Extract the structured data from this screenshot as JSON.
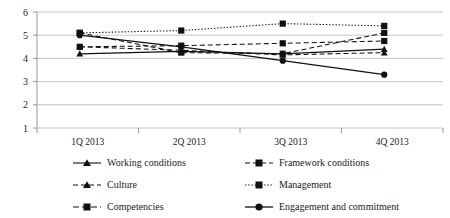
{
  "chart_data": {
    "type": "line",
    "title": "",
    "xlabel": "",
    "ylabel": "",
    "categories": [
      "1Q 2013",
      "2Q 2013",
      "3Q 2013",
      "4Q 2013"
    ],
    "ylim": [
      1,
      6
    ],
    "ytick_labels": [
      "1",
      "2",
      "3",
      "4",
      "5",
      "6"
    ],
    "yticks": [
      1,
      2,
      3,
      4,
      5,
      6
    ],
    "grid": true,
    "legend_position": "bottom",
    "series": [
      {
        "name": "Working conditions",
        "values": [
          4.2,
          4.3,
          4.2,
          4.4
        ],
        "line_style": "solid",
        "marker": "triangle"
      },
      {
        "name": "Framework conditions",
        "values": [
          4.5,
          4.55,
          4.65,
          4.75
        ],
        "line_style": "dashed",
        "marker": "square"
      },
      {
        "name": "Culture",
        "values": [
          4.5,
          4.35,
          4.15,
          4.25
        ],
        "line_style": "dashed",
        "marker": "triangle"
      },
      {
        "name": "Management",
        "values": [
          5.1,
          5.2,
          5.5,
          5.4
        ],
        "line_style": "dotted",
        "marker": "square"
      },
      {
        "name": "Competencies",
        "values": [
          5.1,
          4.25,
          4.2,
          5.1
        ],
        "line_style": "dashed",
        "marker": "square"
      },
      {
        "name": "Engagement and commitment",
        "values": [
          5.0,
          4.5,
          3.9,
          3.3
        ],
        "line_style": "solid",
        "marker": "circle"
      }
    ]
  },
  "legend": {
    "items": [
      {
        "label": "Working conditions"
      },
      {
        "label": "Framework conditions"
      },
      {
        "label": "Culture"
      },
      {
        "label": "Management"
      },
      {
        "label": "Competencies"
      },
      {
        "label": "Engagement and commitment"
      }
    ]
  }
}
